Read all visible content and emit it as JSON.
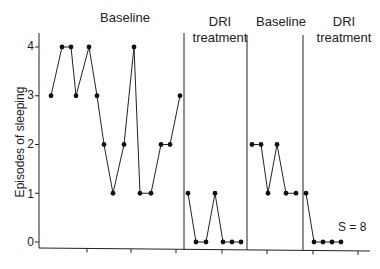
{
  "chart_data": {
    "type": "line",
    "title": "",
    "xlabel": "",
    "ylabel": "Episodes of sleeping",
    "ylim": [
      0,
      4
    ],
    "yticks": [
      0,
      1,
      2,
      3,
      4
    ],
    "grid": false,
    "legend": null,
    "annotation": "S = 8",
    "phases": [
      {
        "label": "Baseline",
        "values": [
          3,
          4,
          4,
          3,
          4,
          3,
          2,
          1,
          2,
          4,
          1,
          1,
          2,
          2,
          3
        ]
      },
      {
        "label": "DRI treatment",
        "values": [
          1,
          0,
          0,
          1,
          0,
          0,
          0
        ]
      },
      {
        "label": "Baseline",
        "values": [
          2,
          2,
          1,
          2,
          1,
          1
        ]
      },
      {
        "label": "DRI treatment",
        "values": [
          1,
          0,
          0,
          0,
          0
        ]
      }
    ]
  },
  "labels": {
    "phase1": "Baseline",
    "phase2_line1": "DRI",
    "phase2_line2": "treatment",
    "phase3": "Baseline",
    "phase4_line1": "DRI",
    "phase4_line2": "treatment",
    "ylabel": "Episodes of sleeping",
    "annotation": "S = 8",
    "yticks": [
      "0",
      "1",
      "2",
      "3",
      "4"
    ]
  }
}
